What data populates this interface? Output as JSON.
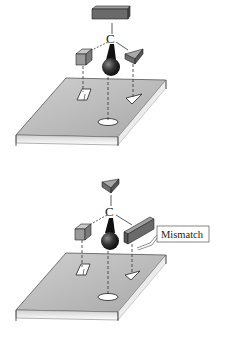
{
  "figure": {
    "panels": [
      {
        "id": "top",
        "center_atom_label": "C",
        "caption": "",
        "groups": [
          "rectangular block (top)",
          "cube (left)",
          "wedge (right)",
          "sphere (front)"
        ],
        "sites": [
          "rectangle",
          "triangle",
          "circle"
        ],
        "match": true
      },
      {
        "id": "bottom",
        "center_atom_label": "C",
        "callout_label": "Mismatch",
        "groups": [
          "wedge (top)",
          "cube (left)",
          "long block (right)",
          "sphere (front)"
        ],
        "sites": [
          "rectangle",
          "triangle",
          "circle"
        ],
        "match": false
      }
    ]
  },
  "colors": {
    "plate_top": "#b9b9b9",
    "plate_edge": "#e6e6e6",
    "block": "#7a7a7a",
    "sphere": "#1e1e1e",
    "line": "#333333"
  }
}
